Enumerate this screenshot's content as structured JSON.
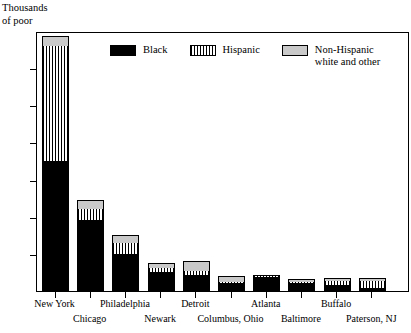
{
  "chart_data": {
    "type": "bar",
    "title": "",
    "subtitle": "",
    "ylabel": "Thousands\nof poor",
    "xlabel": "",
    "stacked": true,
    "grid": false,
    "legend_position": "top-center-inside",
    "ylim": [
      0,
      350
    ],
    "yticks": [
      0,
      50,
      100,
      150,
      200,
      250,
      300,
      350
    ],
    "ytick_labels": [
      "0",
      "50",
      "100",
      "150",
      "200",
      "250",
      "300",
      "350"
    ],
    "categories": [
      "New York",
      "Chicago",
      "Philadelphia",
      "Newark",
      "Detroit",
      "Columbus, Ohio",
      "Atlanta",
      "Baltimore",
      "Buffalo",
      "Paterson, NJ"
    ],
    "series": [
      {
        "name": "Black",
        "pattern": "solid-black",
        "color": "#000000",
        "values": [
          175,
          96,
          50,
          25,
          21,
          11,
          19,
          11,
          8,
          4
        ]
      },
      {
        "name": "Hispanic",
        "pattern": "vertical-stripes",
        "color": "#ffffff",
        "values": [
          155,
          14,
          14,
          6,
          6,
          1,
          1,
          1,
          5,
          10
        ]
      },
      {
        "name": "Non-Hispanic white and other",
        "pattern": "light-gray",
        "color": "#c9c9c9",
        "values": [
          13,
          12,
          12,
          7,
          13,
          8,
          1,
          4,
          4,
          3
        ]
      }
    ],
    "totals": [
      343,
      122,
      76,
      38,
      40,
      20,
      21,
      16,
      17,
      17
    ],
    "legend_entries": [
      {
        "label": "Black",
        "pattern": "solid-black"
      },
      {
        "label": "Hispanic",
        "pattern": "vertical-stripes"
      },
      {
        "label": "Non-Hispanic\nwhite and other",
        "pattern": "light-gray"
      }
    ]
  }
}
